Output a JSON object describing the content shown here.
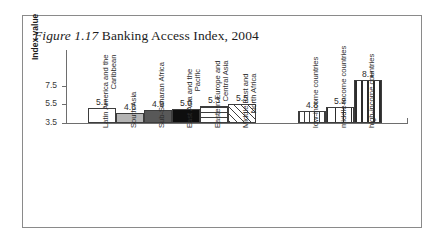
{
  "figure": {
    "number": "Figure 1.17",
    "caption": " Banking Access Index, 2004"
  },
  "chart_data": {
    "type": "bar",
    "title": "Figure 1.17 Banking Access Index, 2004",
    "xlabel": "",
    "ylabel": "Index value",
    "ylim": [
      3.5,
      8.5
    ],
    "yticks": [
      "3.5",
      "5.5",
      "7.5"
    ],
    "grid": false,
    "legend": "none",
    "categories": [
      "Latin America and the\nCaribbean",
      "South Asia",
      "Sub-Saharan Africa",
      "East Asia and the\nPacific",
      "Eastern Europe and\nCentral Asia",
      "Middle East and\nNorth Africa",
      "low-income countries",
      "middle-income countries",
      "high-income countries"
    ],
    "values": [
      5.1,
      4.6,
      4.9,
      5.0,
      5.3,
      5.5,
      4.8,
      5.2,
      8.1
    ],
    "value_labels": [
      "5.1",
      "4.6",
      "4.9",
      "5.0",
      "5.3",
      "5.5",
      "4.8",
      "5.2",
      "8.1"
    ],
    "fills": [
      "white",
      "light-gray",
      "dark-gray",
      "black",
      "horizontal-lines",
      "diagonal-hatch",
      "vertical-lines",
      "sparse-dots",
      "dense-dots"
    ],
    "groups": [
      {
        "name": "regions",
        "indices": [
          0,
          1,
          2,
          3,
          4,
          5
        ]
      },
      {
        "name": "income-groups",
        "indices": [
          6,
          7,
          8
        ]
      }
    ],
    "colors": {
      "axis": "#6e6e6e",
      "bar_outline": "#3d3d3d",
      "text": "#2d2d2d",
      "frame": "#8a8a8a"
    }
  }
}
